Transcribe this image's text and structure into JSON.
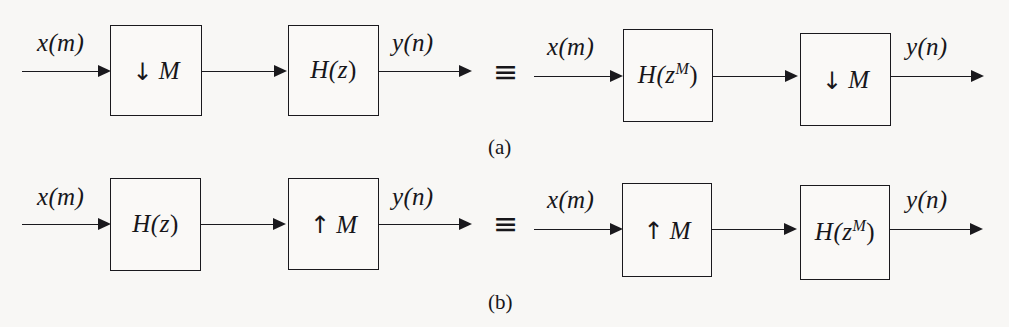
{
  "figure": {
    "background_color": "#f8f7f5",
    "ink_color": "#1a191d",
    "equivalence_symbol": "≡",
    "rows": [
      {
        "caption": "(a)",
        "left": {
          "input_label": "x(m)",
          "output_label": "y(n)",
          "blocks": [
            {
              "kind": "rate",
              "arrow": "↓",
              "factor": "M",
              "text": "↓ M"
            },
            {
              "kind": "filter",
              "text": "H(z)",
              "base": "H(z",
              "sup": "",
              "tail": ")"
            }
          ]
        },
        "right": {
          "input_label": "x(m)",
          "output_label": "y(n)",
          "blocks": [
            {
              "kind": "filter",
              "text": "H(z^M)",
              "base": "H(z",
              "sup": "M",
              "tail": ")"
            },
            {
              "kind": "rate",
              "arrow": "↓",
              "factor": "M",
              "text": "↓ M"
            }
          ]
        }
      },
      {
        "caption": "(b)",
        "left": {
          "input_label": "x(m)",
          "output_label": "y(n)",
          "blocks": [
            {
              "kind": "filter",
              "text": "H(z)",
              "base": "H(z",
              "sup": "",
              "tail": ")"
            },
            {
              "kind": "rate",
              "arrow": "↑",
              "factor": "M",
              "text": "↑ M"
            }
          ]
        },
        "right": {
          "input_label": "x(m)",
          "output_label": "y(n)",
          "blocks": [
            {
              "kind": "rate",
              "arrow": "↑",
              "factor": "M",
              "text": "↑ M"
            },
            {
              "kind": "filter",
              "text": "H(z^M)",
              "base": "H(z",
              "sup": "M",
              "tail": ")"
            }
          ]
        }
      }
    ]
  }
}
